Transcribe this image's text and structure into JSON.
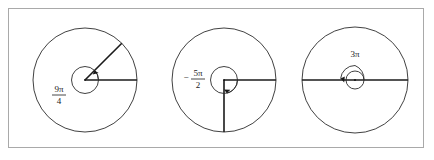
{
  "figure": {
    "background_color": "#ffffff",
    "border_color": "#a9a9a9",
    "stroke_color": "#1a1a1a",
    "panel_count": 3
  },
  "diagrams": [
    {
      "id": "diagram-9pi-over-4",
      "label_kind": "fraction",
      "sign": "",
      "numerator": "9π",
      "denominator": "4",
      "full_label": "9π/4",
      "angle_value_pi": 2.25,
      "direction": "counterclockwise",
      "terminal_ray_degrees": 45,
      "turns": 1.125,
      "center": {
        "x": 85,
        "y": 80
      },
      "radius": 52,
      "label_position": {
        "x": 59,
        "y": 95
      }
    },
    {
      "id": "diagram-negative-5pi-over-2",
      "label_kind": "fraction",
      "sign": "−",
      "numerator": "5π",
      "denominator": "2",
      "full_label": "−5π/2",
      "angle_value_pi": -2.5,
      "direction": "clockwise",
      "terminal_ray_degrees": 270,
      "turns": 1.25,
      "center": {
        "x": 224,
        "y": 80
      },
      "radius": 52,
      "label_position": {
        "x": 196,
        "y": 76
      }
    },
    {
      "id": "diagram-3pi",
      "label_kind": "plain",
      "sign": "",
      "numerator": "3π",
      "denominator": "",
      "full_label": "3π",
      "angle_value_pi": 3,
      "direction": "counterclockwise",
      "terminal_ray_degrees": 180,
      "turns": 1.5,
      "center": {
        "x": 355,
        "y": 80
      },
      "radius": 53,
      "label_position": {
        "x": 355,
        "y": 55
      }
    }
  ]
}
